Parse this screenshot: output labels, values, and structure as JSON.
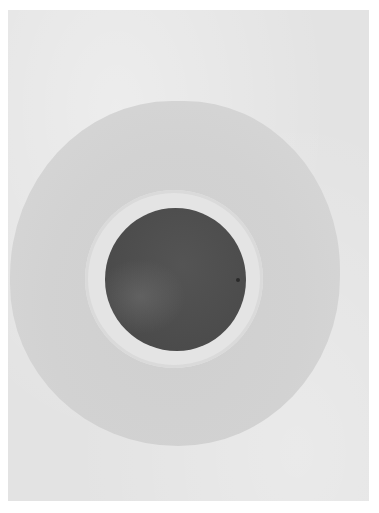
{
  "artwork": {
    "subject": "dark circle with light halo inside a grey circular wash on paper",
    "colors": {
      "page_background": "#ffffff",
      "paper": "#e3e3e3",
      "outer_wash": "#d2d2d2",
      "halo": "#e4e4e4",
      "inner_disc": "#4e4e4e"
    }
  }
}
